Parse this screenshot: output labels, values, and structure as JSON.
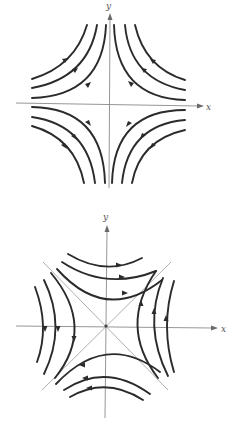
{
  "figures": [
    {
      "id": "top",
      "description": "Phase portrait of a saddle point with trajectories asymptotic to the coordinate axes",
      "axis_labels": {
        "x": "x",
        "y": "y"
      },
      "colors": {
        "curve": "#2b2b2b",
        "axis": "#8a8a8a"
      },
      "asymptotes": [
        "x-axis",
        "y-axis"
      ],
      "trajectories_per_quadrant": 3,
      "flow_direction": "toward y-axis, away from x-axis"
    },
    {
      "id": "bottom",
      "description": "Phase portrait of a saddle point with hyperbolic trajectories asymptotic to the lines y = x and y = -x",
      "axis_labels": {
        "x": "x",
        "y": "y"
      },
      "colors": {
        "curve": "#2b2b2b",
        "axis": "#8a8a8a",
        "diagonal": "#9a9a9a"
      },
      "asymptotes": [
        "y = x",
        "y = -x"
      ],
      "trajectories_per_region": 3,
      "flow_direction": "top branches rightward, bottom branches leftward, right branches upward, left branches downward"
    }
  ]
}
